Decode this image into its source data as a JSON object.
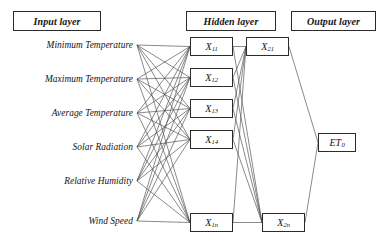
{
  "figure": {
    "type": "neural-network-architecture-diagram"
  },
  "layers": {
    "input": {
      "title": "Input layer",
      "nodes": [
        {
          "id": "min-temperature",
          "label": "Minimum Temperature"
        },
        {
          "id": "max-temperature",
          "label": "Maximum Temperature"
        },
        {
          "id": "avg-temperature",
          "label": "Average Temperature"
        },
        {
          "id": "solar-radiation",
          "label": "Solar Radiation"
        },
        {
          "id": "relative-humidity",
          "label": "Relative Humidity"
        },
        {
          "id": "wind-speed",
          "label": "Wind Speed"
        }
      ]
    },
    "hidden": {
      "title": "Hidden layer",
      "column1": [
        {
          "id": "x11",
          "base": "X",
          "sub": "11"
        },
        {
          "id": "x12",
          "base": "X",
          "sub": "12"
        },
        {
          "id": "x13",
          "base": "X",
          "sub": "13"
        },
        {
          "id": "x14",
          "base": "X",
          "sub": "14"
        },
        {
          "id": "x1n",
          "base": "X",
          "sub": "1n"
        }
      ],
      "column2": [
        {
          "id": "x21",
          "base": "X",
          "sub": "21"
        },
        {
          "id": "x2n",
          "base": "X",
          "sub": "2n"
        }
      ]
    },
    "output": {
      "title": "Output layer",
      "nodes": [
        {
          "id": "et0",
          "base": "ET",
          "sub": "0"
        }
      ]
    }
  },
  "colors": {
    "stroke": "#2b2b2b",
    "wire": "#4a4a4a",
    "text": "#141414",
    "background": "#ffffff"
  },
  "geometry": {
    "width": 384,
    "height": 252,
    "input_rows_y": [
      45,
      79,
      113,
      147,
      181,
      221
    ],
    "input_anchor_x": 137,
    "hidden1_x": 190,
    "hidden1_w": 43,
    "hidden1_h": 19,
    "hidden1_rows_y": [
      37,
      68,
      99,
      130,
      213
    ],
    "hidden2_x": 246,
    "hidden2_w": 43,
    "hidden2_h": 19,
    "hidden2_rows_y": [
      37,
      213
    ],
    "output_x": 318,
    "output_y": 133,
    "output_w": 38,
    "output_h": 19
  }
}
